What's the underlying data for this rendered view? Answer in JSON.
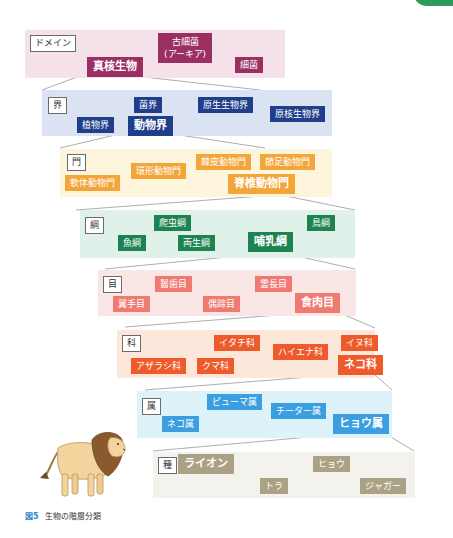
{
  "colors": {
    "domain_band": "#f4e1ea",
    "domain_tag": "#9b2f62",
    "kingdom_band": "#dbe3f3",
    "kingdom_tag": "#1f3f8a",
    "phylum_band": "#fdf4dc",
    "phylum_tag": "#f4a53a",
    "class_band": "#dff1e8",
    "class_tag": "#1d8451",
    "order_band": "#fbe6e6",
    "order_tag": "#ee7a72",
    "family_band": "#fde6da",
    "family_tag": "#ee5a2a",
    "genus_band": "#def2f9",
    "genus_tag": "#3b9ee0",
    "species_band": "#f4f2ec",
    "species_tag": "#aba184",
    "accent_tab": "#2e9a5e"
  },
  "ranks": {
    "domain": {
      "label": "ドメイン",
      "items": [
        "真核生物",
        "古細菌\n(アーキア)",
        "細菌"
      ],
      "highlight": "真核生物"
    },
    "kingdom": {
      "label": "界",
      "items": [
        "菌界",
        "原生生物界",
        "原核生物界",
        "植物界",
        "動物界"
      ],
      "highlight": "動物界"
    },
    "phylum": {
      "label": "門",
      "items": [
        "棘皮動物門",
        "節足動物門",
        "環形動物門",
        "軟体動物門",
        "脊椎動物門"
      ],
      "highlight": "脊椎動物門"
    },
    "class": {
      "label": "綱",
      "items": [
        "爬虫綱",
        "鳥綱",
        "魚綱",
        "両生綱",
        "哺乳綱"
      ],
      "highlight": "哺乳綱"
    },
    "order": {
      "label": "目",
      "items": [
        "齧歯目",
        "霊長目",
        "翼手目",
        "偶蹄目",
        "食肉目"
      ],
      "highlight": "食肉目"
    },
    "family": {
      "label": "科",
      "items": [
        "イタチ科",
        "イヌ科",
        "ハイエナ科",
        "アザラシ科",
        "クマ科",
        "ネコ科"
      ],
      "highlight": "ネコ科"
    },
    "genus": {
      "label": "属",
      "items": [
        "ピューマ属",
        "チーター属",
        "ネコ属",
        "ヒョウ属"
      ],
      "highlight": "ヒョウ属"
    },
    "species": {
      "label": "種",
      "items": [
        "ライオン",
        "ヒョウ",
        "トラ",
        "ジャガー"
      ],
      "highlight": "ライオン"
    }
  },
  "illustration": {
    "subject": "lion"
  },
  "caption": {
    "figure_number": "図5",
    "text": "生物の階層分類"
  }
}
